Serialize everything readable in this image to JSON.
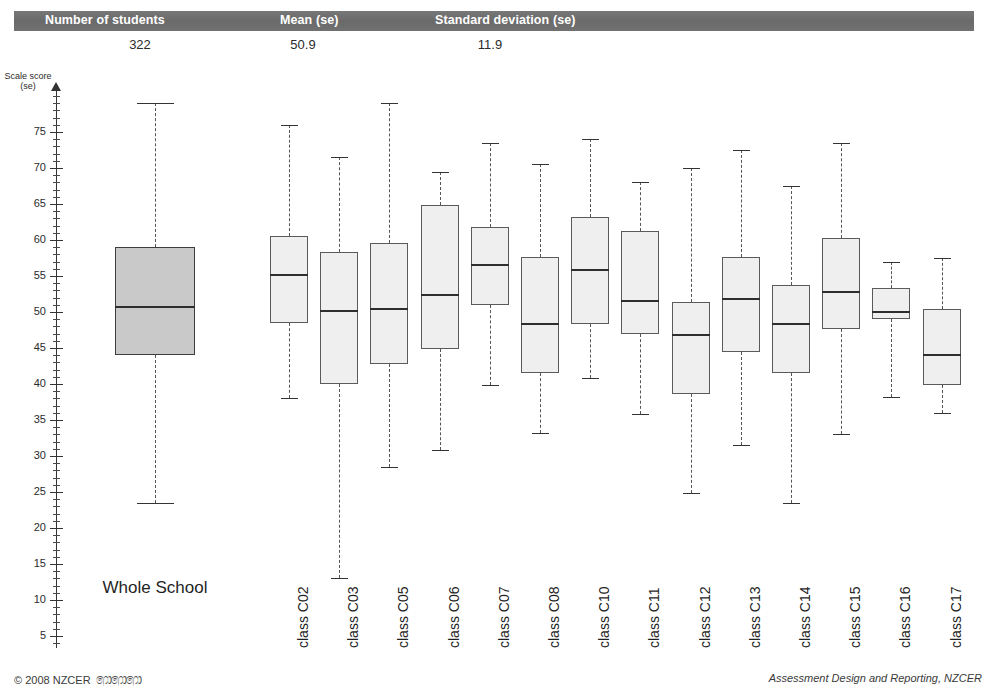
{
  "summary_table": {
    "headers": [
      "Number of students",
      "Mean (se)",
      "Standard deviation (se)"
    ],
    "values": [
      "322",
      "50.9",
      "11.9"
    ],
    "header_band_color": "#6e6e6e",
    "header_text_color": "#ffffff"
  },
  "axis": {
    "title": "Scale score\n(se)",
    "tick_labels": [
      "75",
      "70",
      "65",
      "60",
      "55",
      "50",
      "45",
      "40",
      "35",
      "30",
      "25",
      "20",
      "15",
      "10",
      "5"
    ],
    "tick_values": [
      75,
      70,
      65,
      60,
      55,
      50,
      45,
      40,
      35,
      30,
      25,
      20,
      15,
      10,
      5
    ],
    "minor_tick_step": 1,
    "range": [
      2,
      80
    ]
  },
  "footer": {
    "copyright": "© 2008 NZCER",
    "koru": "෩෩෩",
    "right_text": "Assessment Design and Reporting, NZCER"
  },
  "chart_data": {
    "type": "box",
    "title": "",
    "xlabel": "",
    "ylabel": "Scale score (se)",
    "ylim": [
      2,
      80
    ],
    "grid": false,
    "legend": "none",
    "overall": {
      "label": "Whole School",
      "n": 322,
      "mean": 50.9,
      "sd": 11.9,
      "min": 23.5,
      "q1": 44.0,
      "median": 50.8,
      "q3": 59.0,
      "max": 79.0,
      "fill": "#c9c9c9"
    },
    "categories": [
      "class C02",
      "class C03",
      "class C05",
      "class C06",
      "class C07",
      "class C08",
      "class C10",
      "class C11",
      "class C12",
      "class C13",
      "class C14",
      "class C15",
      "class C16",
      "class C17"
    ],
    "boxes": [
      {
        "label": "class C02",
        "min": 38.0,
        "q1": 48.5,
        "median": 55.3,
        "q3": 60.5,
        "max": 76.0
      },
      {
        "label": "class C03",
        "min": 13.0,
        "q1": 40.0,
        "median": 50.3,
        "q3": 58.3,
        "max": 71.5
      },
      {
        "label": "class C05",
        "min": 28.5,
        "q1": 42.8,
        "median": 50.5,
        "q3": 59.6,
        "max": 79.0
      },
      {
        "label": "class C06",
        "min": 30.8,
        "q1": 44.8,
        "median": 52.5,
        "q3": 64.9,
        "max": 69.5
      },
      {
        "label": "class C07",
        "min": 39.8,
        "q1": 51.0,
        "median": 56.6,
        "q3": 61.8,
        "max": 73.5
      },
      {
        "label": "class C08",
        "min": 33.2,
        "q1": 41.5,
        "median": 48.5,
        "q3": 57.6,
        "max": 70.5
      },
      {
        "label": "class C10",
        "min": 40.8,
        "q1": 48.3,
        "median": 56.0,
        "q3": 63.2,
        "max": 74.0
      },
      {
        "label": "class C11",
        "min": 35.8,
        "q1": 47.0,
        "median": 51.7,
        "q3": 61.2,
        "max": 68.0
      },
      {
        "label": "class C12",
        "min": 24.8,
        "q1": 38.6,
        "median": 46.9,
        "q3": 51.4,
        "max": 70.0
      },
      {
        "label": "class C13",
        "min": 31.5,
        "q1": 44.4,
        "median": 51.9,
        "q3": 57.7,
        "max": 72.5
      },
      {
        "label": "class C14",
        "min": 23.5,
        "q1": 41.5,
        "median": 48.5,
        "q3": 53.8,
        "max": 67.5
      },
      {
        "label": "class C15",
        "min": 33.0,
        "q1": 47.7,
        "median": 52.9,
        "q3": 60.3,
        "max": 73.5
      },
      {
        "label": "class C16",
        "min": 38.2,
        "q1": 49.0,
        "median": 50.2,
        "q3": 53.4,
        "max": 57.0
      },
      {
        "label": "class C17",
        "min": 36.0,
        "q1": 39.9,
        "median": 44.2,
        "q3": 50.4,
        "max": 57.5
      }
    ]
  }
}
